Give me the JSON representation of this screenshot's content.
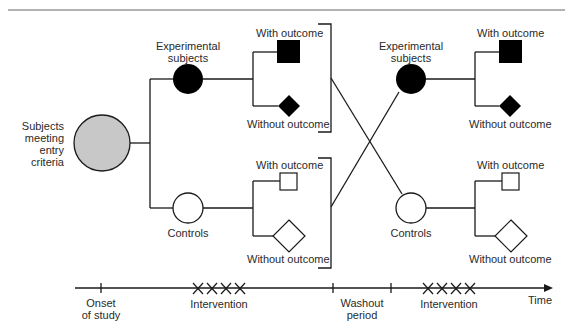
{
  "diagram": {
    "type": "crossover-trial-flow",
    "population": {
      "label_lines": [
        "Subjects",
        "meeting",
        "entry",
        "criteria"
      ],
      "fill": "#c8c8c8"
    },
    "period1": {
      "experimental": {
        "label_lines": [
          "Experimental",
          "subjects"
        ],
        "fill": "#000000",
        "outcomes": {
          "with": "With outcome",
          "without": "Without outcome"
        }
      },
      "controls": {
        "label": "Controls",
        "fill": "#ffffff",
        "outcomes": {
          "with": "With outcome",
          "without": "Without outcome"
        }
      }
    },
    "period2": {
      "experimental": {
        "label_lines": [
          "Experimental",
          "subjects"
        ],
        "fill": "#000000",
        "outcomes": {
          "with": "With outcome",
          "without": "Without outcome"
        }
      },
      "controls": {
        "label": "Controls",
        "fill": "#ffffff",
        "outcomes": {
          "with": "With outcome",
          "without": "Without outcome"
        }
      }
    },
    "timeline": {
      "onset": [
        "Onset",
        "of study"
      ],
      "intervention1": "Intervention",
      "washout": [
        "Washout",
        "period"
      ],
      "intervention2": "Intervention",
      "axis_label": "Time",
      "intervention_marks": "XXXX"
    },
    "colors": {
      "line": "#1a1a1a",
      "gray_fill": "#c8c8c8",
      "rule": "#555555"
    }
  }
}
